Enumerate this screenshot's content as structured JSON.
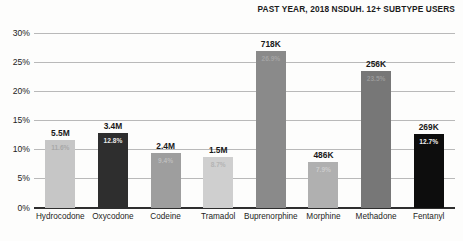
{
  "chart_data": {
    "type": "bar",
    "title": "PAST YEAR, 2018 NSDUH. 12+ SUBTYPE USERS",
    "xlabel": "",
    "ylabel": "",
    "ylim": [
      0,
      30
    ],
    "ytick_labels": [
      "0%",
      "5%",
      "10%",
      "15%",
      "20%",
      "25%",
      "30%"
    ],
    "ytick_values": [
      0,
      5,
      10,
      15,
      20,
      25,
      30
    ],
    "grid": true,
    "legend": "none",
    "categories": [
      "Hydrocodone",
      "Oxycodone",
      "Codeine",
      "Tramadol",
      "Buprenorphine",
      "Morphine",
      "Methadone",
      "Fentanyl"
    ],
    "values": [
      11.6,
      12.8,
      9.4,
      8.7,
      26.9,
      7.9,
      23.5,
      12.7
    ],
    "value_labels": [
      "11.6%",
      "12.8%",
      "9.4%",
      "8.7%",
      "26.9%",
      "7.9%",
      "23.5%",
      "12.7%"
    ],
    "count_labels": [
      "5.5M",
      "3.4M",
      "2.4M",
      "1.5M",
      "718K",
      "486K",
      "256K",
      "269K"
    ],
    "bar_colors": [
      "#c6c6c6",
      "#2e2e2e",
      "#9e9e9e",
      "#cfcfcf",
      "#8a8a8a",
      "#b0b0b0",
      "#777777",
      "#0d0d0d"
    ],
    "value_label_colors": [
      "#a8a8a8",
      "#e8e8e8",
      "#bdbdbd",
      "#b4b4b4",
      "#a4a4a4",
      "#cccccc",
      "#9a9a9a",
      "#f0f0f0"
    ]
  }
}
